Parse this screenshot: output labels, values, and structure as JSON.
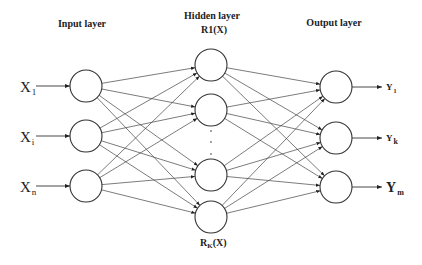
{
  "diagram": {
    "type": "neural-network",
    "layers": {
      "input": {
        "title": "Input layer",
        "nodes": [
          {
            "label": "X",
            "sub": "1"
          },
          {
            "label": "X",
            "sub": "i"
          },
          {
            "label": "X",
            "sub": "n"
          }
        ]
      },
      "hidden": {
        "title": "Hidden layer",
        "top_label": "R1(X)",
        "bottom_label_main": "R",
        "bottom_label_sub": "K",
        "bottom_label_tail": "(X)",
        "node_count_shown": 4,
        "ellipsis": "⋮"
      },
      "output": {
        "title": "Output layer",
        "nodes": [
          {
            "label": "Y",
            "sub": "1"
          },
          {
            "label": "Y",
            "sub": "k"
          },
          {
            "label": "Y",
            "sub": "m"
          }
        ]
      }
    },
    "connections": "fully-connected input→hidden and hidden→output, with arrowheads"
  }
}
